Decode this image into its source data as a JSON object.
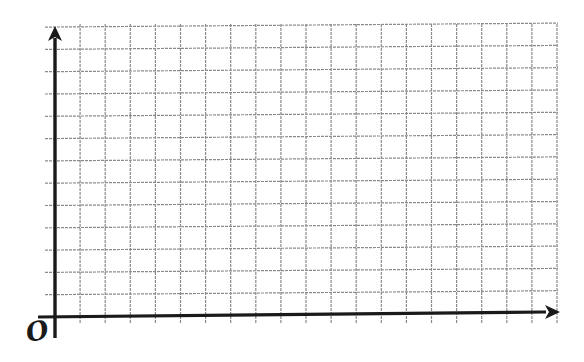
{
  "diagram": {
    "type": "blank-coordinate-grid",
    "origin_label": "O",
    "x_axis": {
      "label": "",
      "arrow": true
    },
    "y_axis": {
      "label": "",
      "arrow": true
    },
    "grid": {
      "columns": 20,
      "rows": 13,
      "cell_width_px": 25.1,
      "cell_height_px": 22.3
    },
    "colors": {
      "axis": "#1a1a1a",
      "grid_line": "#8a8a8a",
      "background": "#ffffff"
    }
  }
}
